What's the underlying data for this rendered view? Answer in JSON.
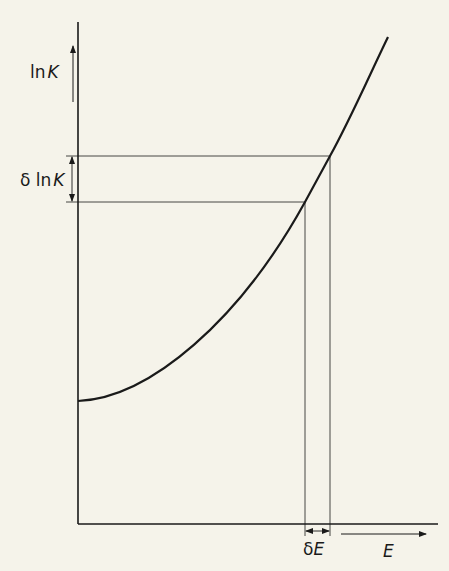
{
  "diagram": {
    "y_axis_label": "ln K",
    "y_axis_label_parts": {
      "prefix": "ln",
      "var": "K"
    },
    "delta_y_label": "δ ln K",
    "delta_y_label_parts": {
      "prefix": "δ ln",
      "var": "K"
    },
    "x_axis_label": "E",
    "delta_x_label": "δE",
    "delta_x_label_parts": {
      "prefix": "δ",
      "var": "E"
    },
    "curve_description": "ln K increasing convexly with E; a small increment δE corresponds to an increment δ ln K",
    "colors": {
      "background": "#f5f3ea",
      "ink": "#1a1a1a"
    }
  }
}
